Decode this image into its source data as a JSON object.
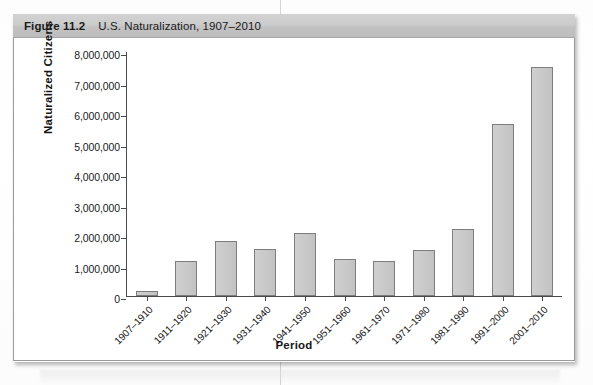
{
  "figure": {
    "number_label": "Figure 11.2",
    "title": "U.S. Naturalization, 1907–2010"
  },
  "chart_data": {
    "type": "bar",
    "title": "U.S. Naturalization, 1907–2010",
    "xlabel": "Period",
    "ylabel": "Naturalized Citizens",
    "categories": [
      "1907–1910",
      "1911–1920",
      "1921–1930",
      "1931–1940",
      "1941–1950",
      "1951–1960",
      "1961–1970",
      "1971–1980",
      "1981–1990",
      "1991–2000",
      "2001–2010"
    ],
    "values": [
      150000,
      1150000,
      1800000,
      1550000,
      2050000,
      1200000,
      1150000,
      1500000,
      2200000,
      5650000,
      7500000
    ],
    "ylim": [
      0,
      8000000
    ],
    "ytick_values": [
      0,
      1000000,
      2000000,
      3000000,
      4000000,
      5000000,
      6000000,
      7000000,
      8000000
    ],
    "ytick_labels": [
      "0",
      "1,000,000",
      "2,000,000",
      "3,000,000",
      "4,000,000",
      "5,000,000",
      "6,000,000",
      "7,000,000",
      "8,000,000"
    ],
    "grid": false,
    "legend": null,
    "bar_color": "#c9c9c9",
    "bar_border_color": "#7d7d7d",
    "xtick_rotation": -45
  },
  "colors": {
    "header_band": "#c8c8c8",
    "panel_background": "#ffffff",
    "axis": "#4a4a4a",
    "text": "#1b1b1b"
  }
}
